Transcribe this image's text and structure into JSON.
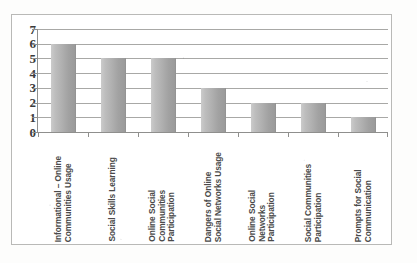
{
  "chart_data": {
    "type": "bar",
    "title": "",
    "subtitle": "",
    "xlabel": "",
    "ylabel": "",
    "ylim": [
      0,
      7
    ],
    "y_ticks": [
      0,
      1,
      2,
      3,
      4,
      5,
      6,
      7
    ],
    "grid": true,
    "grid_axis": "y",
    "legend": false,
    "legend_position": "none",
    "orientation": "vertical",
    "bar_color": "#b0b0b0",
    "categories": [
      "Informational – Online Communities Usage",
      "Social Skills Learning",
      "Online Social Communities Participation",
      "Dangers of Online Social Networks Usage",
      "Online Social Networks Participation",
      "Social Communities Participation",
      "Prompts for Social Communication"
    ],
    "category_label_lines": [
      [
        "Informational – Online",
        "Communities Usage"
      ],
      [
        "Social Skills Learning"
      ],
      [
        "Online Social",
        "Communities",
        "Participation"
      ],
      [
        "Dangers of Online",
        "Social Networks Usage"
      ],
      [
        "Online Social",
        "Networks",
        "Participation"
      ],
      [
        "Social Communities",
        "Participation"
      ],
      [
        "Prompts for Social",
        "Communication"
      ]
    ],
    "values": [
      6,
      5,
      5,
      3,
      2,
      2,
      1
    ],
    "annotations": []
  },
  "colors": {
    "frame": "#b9b9b7",
    "gridline": "#a8a8a6",
    "axis": "#8f8f8d",
    "bar_light": "#cbcbcb",
    "bar_dark": "#9a9a9a",
    "tick_text": "#3b3b3b",
    "label_text": "#4a4a4a",
    "background": "#ffffff"
  }
}
